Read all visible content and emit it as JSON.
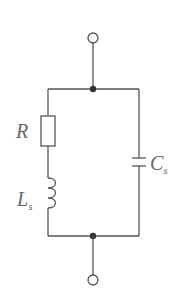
{
  "diagram": {
    "type": "circuit",
    "components": [
      {
        "id": "R",
        "label": "R",
        "sub": "",
        "kind": "resistor"
      },
      {
        "id": "Ls",
        "label": "L",
        "sub": "s",
        "kind": "inductor"
      },
      {
        "id": "Cs",
        "label": "C",
        "sub": "s",
        "kind": "capacitor"
      }
    ],
    "terminals": [
      {
        "id": "top",
        "kind": "open-terminal"
      },
      {
        "id": "bottom",
        "kind": "open-terminal"
      }
    ],
    "junctions": [
      {
        "id": "top-node"
      },
      {
        "id": "bottom-node"
      }
    ],
    "colors": {
      "wire": "#555555",
      "label": "#666666",
      "background": "#ffffff"
    }
  }
}
